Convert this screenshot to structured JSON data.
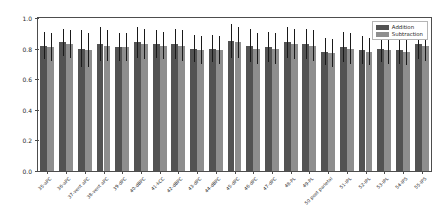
{
  "chart_data": {
    "type": "bar",
    "title": "",
    "xlabel": "",
    "ylabel": "Nodal Efficiency",
    "ylim": [
      0.0,
      1.0
    ],
    "yticks": [
      "0.0",
      "0.2",
      "0.4",
      "0.6",
      "0.8",
      "1.0"
    ],
    "ytick_values": [
      0.0,
      0.2,
      0.4,
      0.6,
      0.8,
      1.0
    ],
    "grid": false,
    "legend_position": "upper right",
    "categories": [
      "35-aPC",
      "36-aPC",
      "37-vent aPC",
      "38-vent aPC",
      "39-dPC",
      "40-dBPC",
      "41-kCC",
      "42-dBPC",
      "43-dPC",
      "44-dBPC",
      "45-dPC",
      "46-dPC",
      "47-dPC",
      "48-PL",
      "49-PL",
      "50 post parietal",
      "51-IPL",
      "52-IPL",
      "53-IPL",
      "54-IPS",
      "55-IPS"
    ],
    "series": [
      {
        "name": "Addition",
        "color": "#535353",
        "values": [
          0.82,
          0.84,
          0.8,
          0.83,
          0.81,
          0.84,
          0.83,
          0.83,
          0.8,
          0.8,
          0.85,
          0.82,
          0.81,
          0.84,
          0.83,
          0.78,
          0.81,
          0.79,
          0.8,
          0.79,
          0.83
        ],
        "errors": [
          0.09,
          0.09,
          0.12,
          0.11,
          0.09,
          0.1,
          0.09,
          0.1,
          0.09,
          0.09,
          0.11,
          0.11,
          0.1,
          0.1,
          0.1,
          0.09,
          0.1,
          0.09,
          0.09,
          0.09,
          0.1
        ]
      },
      {
        "name": "Subtraction",
        "color": "#8e8e8e",
        "values": [
          0.81,
          0.83,
          0.79,
          0.82,
          0.81,
          0.83,
          0.82,
          0.82,
          0.79,
          0.79,
          0.84,
          0.8,
          0.8,
          0.83,
          0.82,
          0.77,
          0.8,
          0.78,
          0.79,
          0.78,
          0.82
        ],
        "errors": [
          0.09,
          0.09,
          0.11,
          0.1,
          0.09,
          0.1,
          0.09,
          0.1,
          0.09,
          0.09,
          0.1,
          0.1,
          0.1,
          0.1,
          0.1,
          0.09,
          0.1,
          0.09,
          0.09,
          0.09,
          0.1
        ]
      }
    ]
  },
  "legend": {
    "entries": [
      {
        "label": "Addition"
      },
      {
        "label": "Subtraction"
      }
    ]
  }
}
